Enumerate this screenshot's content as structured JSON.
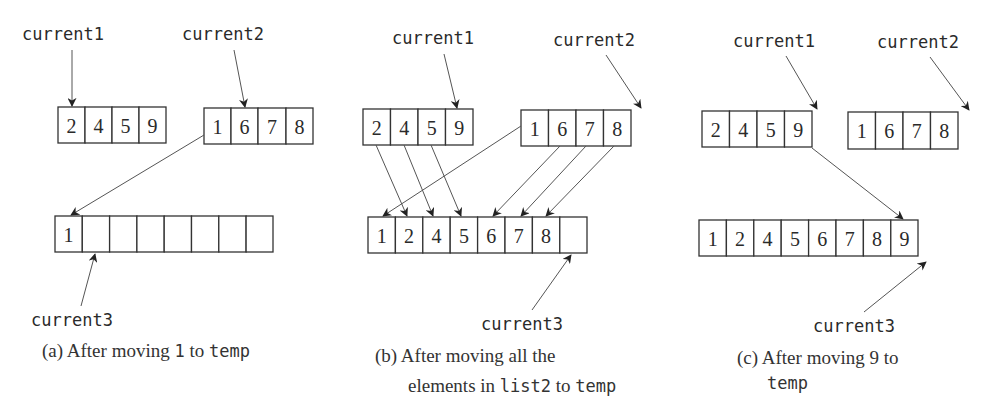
{
  "panels": [
    {
      "id": "a",
      "pointers": {
        "current1": "current1",
        "current2": "current2",
        "current3": "current3"
      },
      "list1": [
        "2",
        "4",
        "5",
        "9"
      ],
      "list2": [
        "1",
        "6",
        "7",
        "8"
      ],
      "temp": [
        "1",
        "",
        "",
        "",
        "",
        "",
        "",
        ""
      ],
      "caption": {
        "prefix": "(a) After moving ",
        "code1": "1",
        "mid": " to ",
        "code2": "temp"
      }
    },
    {
      "id": "b",
      "pointers": {
        "current1": "current1",
        "current2": "current2",
        "current3": "current3"
      },
      "list1": [
        "2",
        "4",
        "5",
        "9"
      ],
      "list2": [
        "1",
        "6",
        "7",
        "8"
      ],
      "temp": [
        "1",
        "2",
        "4",
        "5",
        "6",
        "7",
        "8",
        ""
      ],
      "caption": {
        "line1": "(b) After moving all the",
        "line2_prefix": "elements in ",
        "code1": "list2",
        "mid": " to ",
        "code2": "temp"
      }
    },
    {
      "id": "c",
      "pointers": {
        "current1": "current1",
        "current2": "current2",
        "current3": "current3"
      },
      "list1": [
        "2",
        "4",
        "5",
        "9"
      ],
      "list2": [
        "1",
        "6",
        "7",
        "8"
      ],
      "temp": [
        "1",
        "2",
        "4",
        "5",
        "6",
        "7",
        "8",
        "9"
      ],
      "caption": {
        "line1": "(c) After moving 9 to",
        "code2": "temp"
      }
    }
  ],
  "colors": {
    "stroke": "#333333",
    "pointer": "#555555",
    "text": "#2a2a2a"
  }
}
